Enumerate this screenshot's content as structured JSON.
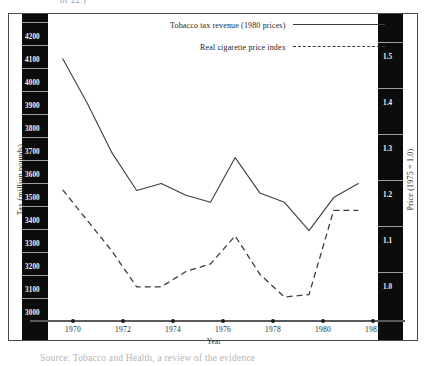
{
  "figure": {
    "top_partial_text": "of 22.)",
    "bottom_partial_caption": "Source: Tobacco and Health, a review of the evidence"
  },
  "axes": {
    "left": {
      "title": "Tax (million pounds)",
      "ticks": [
        "4200",
        "4100",
        "4000",
        "3900",
        "3800",
        "3700",
        "3600",
        "3500",
        "3400",
        "3300",
        "3200",
        "3100",
        "3000"
      ]
    },
    "right": {
      "title": "Price (1975 = 1.0)",
      "ticks": [
        "1.5",
        "1.4",
        "1.3",
        "1.2",
        "1.1",
        "1.0"
      ]
    },
    "bottom": {
      "title": "Year",
      "ticks": [
        "1970",
        "1972",
        "1974",
        "1976",
        "1978",
        "1980",
        "1982"
      ]
    }
  },
  "legend": {
    "entries": [
      {
        "label": "Tobacco tax revenue (1980 prices)",
        "style": "solid"
      },
      {
        "label": "Real cigarette price index",
        "style": "dashed"
      }
    ]
  },
  "chart_data": {
    "type": "line",
    "title": "",
    "xlabel": "Year",
    "ylabel": "Tax (million pounds)",
    "y2label": "Price (1975 = 1.0)",
    "grid": false,
    "legend_position": "top-center",
    "x": [
      1970,
      1971,
      1972,
      1973,
      1974,
      1975,
      1976,
      1977,
      1978,
      1979,
      1980,
      1981,
      1982
    ],
    "xlim": [
      1969.4,
      1982.8
    ],
    "ylim": [
      2950,
      4250
    ],
    "y2lim": [
      0.94,
      1.54
    ],
    "series": [
      {
        "name": "Tobacco tax revenue (1980 prices)",
        "axis": "left",
        "style": "solid",
        "units": "million pounds",
        "values": [
          4060,
          3870,
          3660,
          3500,
          3530,
          3480,
          3450,
          3640,
          3490,
          3450,
          3330,
          3470,
          3530
        ]
      },
      {
        "name": "Real cigarette price index",
        "axis": "right",
        "style": "dashed",
        "units": "index (1975 = 1.0)",
        "values": [
          1.195,
          1.135,
          1.075,
          1.005,
          1.005,
          1.035,
          1.05,
          1.105,
          1.03,
          0.985,
          0.99,
          1.155,
          1.155
        ]
      }
    ]
  }
}
